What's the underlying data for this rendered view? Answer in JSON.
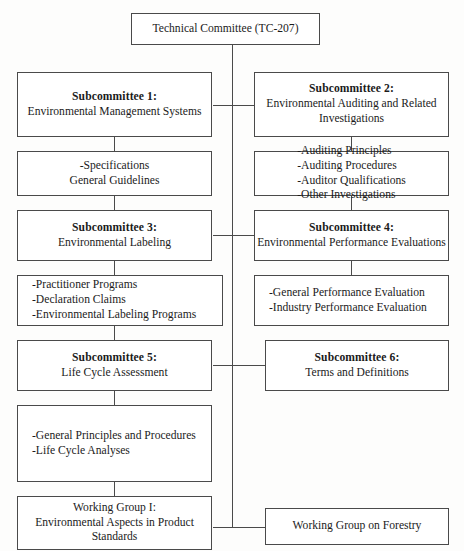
{
  "diagram": {
    "root": {
      "label": "Technical Committee (TC-207)"
    },
    "nodes": {
      "sc1": {
        "title": "Subcommittee 1:",
        "subtitle": "Environmental Management Systems"
      },
      "sc1_detail": {
        "lines": [
          "-Specifications",
          "General Guidelines"
        ]
      },
      "sc2": {
        "title": "Subcommittee 2:",
        "subtitle": "Environmental Auditing and Related Investigations"
      },
      "sc2_detail": {
        "lines": [
          "-Auditing Principles",
          "-Auditing Procedures",
          "-Auditor Qualifications",
          "-Other Investigations"
        ]
      },
      "sc3": {
        "title": "Subcommittee 3:",
        "subtitle": "Environmental Labeling"
      },
      "sc3_detail": {
        "lines": [
          "-Practitioner Programs",
          "-Declaration Claims",
          "-Environmental Labeling Programs"
        ]
      },
      "sc4": {
        "title": "Subcommittee 4:",
        "subtitle": "Environmental Performance Evaluations"
      },
      "sc4_detail": {
        "lines": [
          "-General Performance Evaluation",
          "-Industry Performance Evaluation"
        ]
      },
      "sc5": {
        "title": "Subcommittee 5:",
        "subtitle": "Life Cycle Assessment"
      },
      "sc5_detail": {
        "lines": [
          "-General Principles and Procedures",
          "-Life Cycle Analyses"
        ]
      },
      "sc6": {
        "title": "Subcommittee 6:",
        "subtitle": "Terms and Definitions"
      },
      "wg1": {
        "title": "Working Group I:",
        "subtitle": "Environmental Aspects in Product Standards"
      },
      "wg_forestry": {
        "label": "Working Group on Forestry"
      }
    },
    "colors": {
      "border": "#4a4a4a",
      "text": "#1b1b1b",
      "background": "#fdfdfc"
    }
  }
}
